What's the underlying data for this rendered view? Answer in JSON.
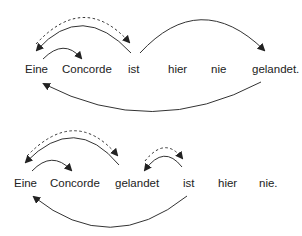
{
  "diagram": {
    "sentence1": {
      "words": [
        "Eine",
        "Concorde",
        "ist",
        "hier",
        "nie",
        "gelandet."
      ]
    },
    "sentence2": {
      "words": [
        "Eine",
        "Concorde",
        "gelandet",
        "ist",
        "hier",
        "nie."
      ]
    },
    "colors": {
      "line": "#333333",
      "text": "#222222"
    }
  }
}
